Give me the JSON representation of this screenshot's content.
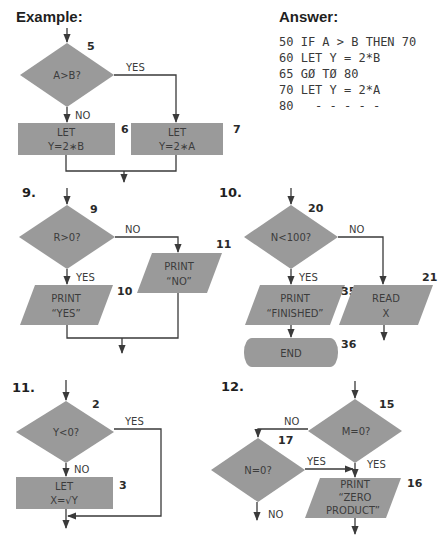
{
  "example": {
    "title": "Example:",
    "decision": {
      "label": "A>B?",
      "number": "5"
    },
    "yes_label": "YES",
    "no_label": "NO",
    "box_left": {
      "line1": "LET",
      "line2": "Y=2∗B",
      "number": "6"
    },
    "box_right": {
      "line1": "LET",
      "line2": "Y=2∗A",
      "number": "7"
    }
  },
  "answer": {
    "title": "Answer:",
    "lines": [
      "50 IF A > B THEN 70",
      "60 LET Y = 2*B",
      "65 GØ TØ 80",
      "70 LET Y = 2*A",
      "80   - - - - -"
    ]
  },
  "problem9": {
    "label": "9.",
    "decision": {
      "label": "R>0?",
      "number": "9"
    },
    "no_label": "NO",
    "yes_label": "YES",
    "yes_box": {
      "line1": "PRINT",
      "line2": "“YES”",
      "number": "10"
    },
    "no_box": {
      "line1": "PRINT",
      "line2": "“NO”",
      "number": "11"
    }
  },
  "problem10": {
    "label": "10.",
    "decision": {
      "label": "N<100?",
      "number": "20"
    },
    "no_label": "NO",
    "yes_label": "YES",
    "print_box": {
      "line1": "PRINT",
      "line2": "“FINISHED”",
      "number": "35"
    },
    "end_box": {
      "label": "END",
      "number": "36"
    },
    "read_box": {
      "line1": "READ",
      "line2": "X",
      "number": "21"
    }
  },
  "problem11": {
    "label": "11.",
    "decision": {
      "label": "Y<0?",
      "number": "2"
    },
    "yes_label": "YES",
    "no_label": "NO",
    "let_box": {
      "line1": "LET",
      "line2": "X=√Y",
      "number": "3"
    }
  },
  "problem12": {
    "label": "12.",
    "decision_m": {
      "label": "M=0?",
      "number": "15"
    },
    "decision_n": {
      "label": "N=0?",
      "number": "17"
    },
    "m_no_label": "NO",
    "m_yes_label": "YES",
    "n_yes_label": "YES",
    "n_no_label": "NO",
    "print_box": {
      "line1": "PRINT",
      "line2": "“ZERO",
      "line3": "PRODUCT”",
      "number": "16"
    }
  },
  "colors": {
    "shape_fill": "#9a9a9a",
    "line": "#3a3a3a",
    "text": "#3c3c3c"
  }
}
